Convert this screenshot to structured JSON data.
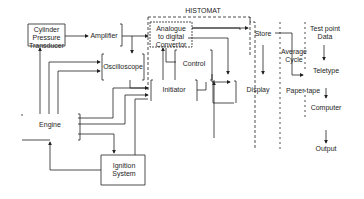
{
  "diagram": {
    "group_title": "HISTOMAT",
    "blocks": {
      "transducer": "Cylinder\nPressure\nTransducer",
      "amplifier": "Amplifier",
      "adc": "Analogue\nto digital\nConvertor",
      "oscilloscope": "Oscilloscope",
      "control": "Control",
      "initiator": "Initiator",
      "store": "Store",
      "display": "Display",
      "engine": "Engine",
      "ignition": "Ignition\nSystem",
      "average_cycle": "Average\nCycle",
      "test_point_data": "Test point\nData",
      "teletype": "Teletype",
      "paper_tape": "Paper tape",
      "computer": "Computer",
      "output": "Output"
    },
    "line_color": "#222222"
  }
}
